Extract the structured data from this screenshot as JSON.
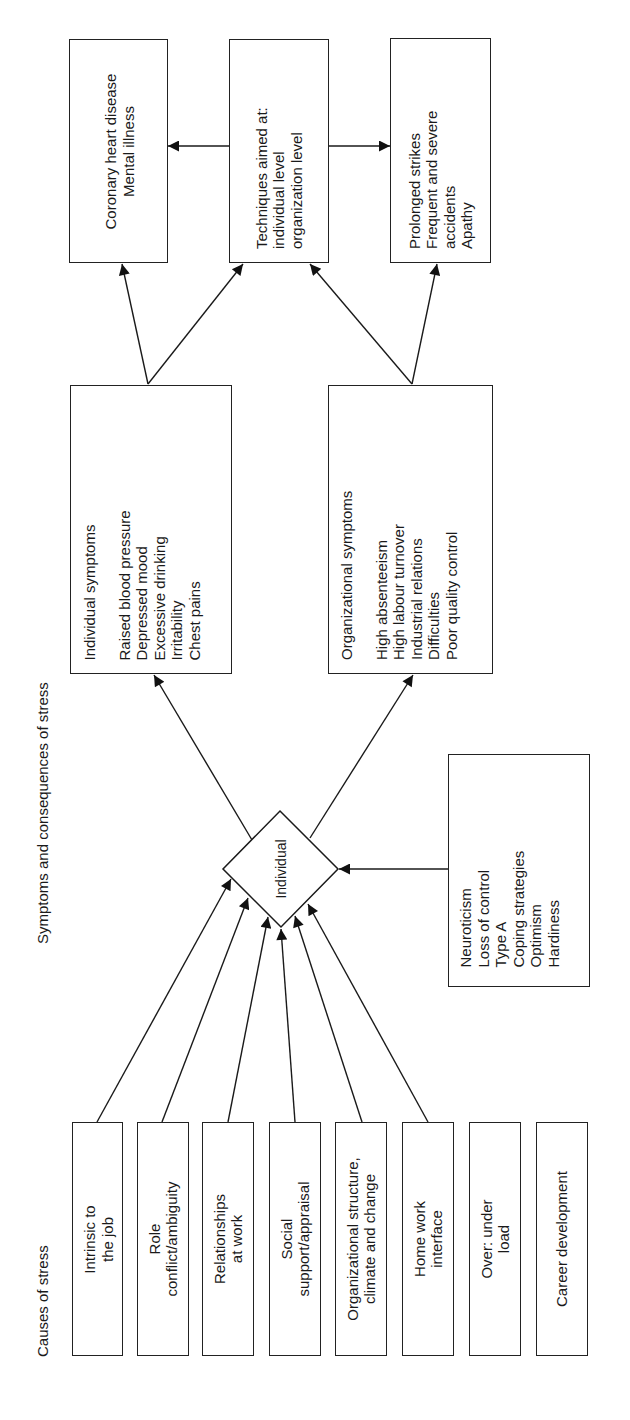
{
  "labels": {
    "causes_title": "Causes of stress",
    "symptoms_title": "Symptoms and consequences of stress",
    "individual_node": "Individual"
  },
  "causes": [
    {
      "lines": [
        "Intrinsic to",
        "the job"
      ]
    },
    {
      "lines": [
        "Role",
        "conflict/ambiguity"
      ]
    },
    {
      "lines": [
        "Relationships",
        "at work"
      ]
    },
    {
      "lines": [
        "Social",
        "support/appraisal"
      ]
    },
    {
      "lines": [
        "Organizational structure,",
        "climate and change"
      ]
    },
    {
      "lines": [
        "Home work",
        "interface"
      ]
    },
    {
      "lines": [
        "Over: under",
        "load"
      ]
    },
    {
      "lines": [
        "Career development"
      ]
    }
  ],
  "moderators": {
    "lines": [
      "Neuroticism",
      "Loss of control",
      "Type A",
      "Coping strategies",
      "Optimism",
      "Hardiness"
    ]
  },
  "individual_symptoms": {
    "heading": "Individual symptoms",
    "lines": [
      "Raised blood pressure",
      "Depressed mood",
      "Excessive drinking",
      "Irritability",
      "Chest pains"
    ]
  },
  "organizational_symptoms": {
    "heading": "Organizational symptoms",
    "lines": [
      "High absenteeism",
      "High labour turnover",
      "Industrial relations",
      "Difficulties",
      "Poor quality control"
    ]
  },
  "outcomes": {
    "individual": {
      "lines": [
        "Coronary heart disease",
        "Mental illness"
      ]
    },
    "interventions": {
      "lines": [
        "Techniques aimed at:",
        "individual level",
        "organization level"
      ]
    },
    "organizational": {
      "lines": [
        "Prolonged strikes",
        "Frequent and severe",
        "accidents",
        "Apathy"
      ]
    }
  },
  "colors": {
    "stroke": "#222222",
    "background": "#ffffff",
    "text": "#1a1a1a"
  }
}
